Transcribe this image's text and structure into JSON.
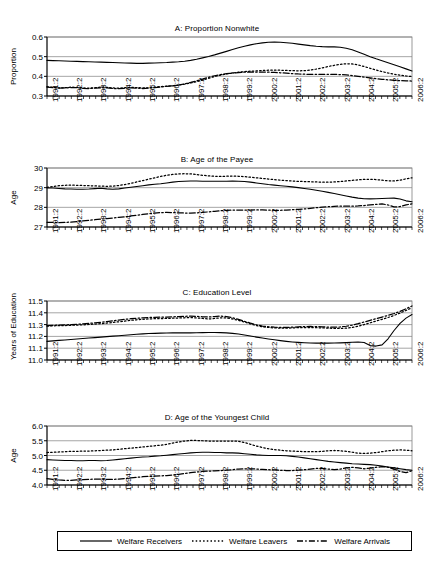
{
  "figure": {
    "background": "#ffffff",
    "line_color": "#000000",
    "grid_color": "#808080",
    "axis_color": "#000000"
  },
  "legend": {
    "items": [
      {
        "label": "Welfare Receivers",
        "style": "solid",
        "dash": "none"
      },
      {
        "label": "Welfare Leavers",
        "style": "dotted",
        "dash": "1.5,2.2"
      },
      {
        "label": "Welfare Arrivals",
        "style": "dash-dot",
        "dash": "6,2.2,1.5,2.2"
      }
    ]
  },
  "x_axis": {
    "tick_labels": [
      "1991:2",
      "1992:2",
      "1993:2",
      "1994:2",
      "1995:2",
      "1996:2",
      "1997:2",
      "1998:2",
      "1999:2",
      "2000:2",
      "2001:2",
      "2002:2",
      "2003:2",
      "2004:2",
      "2005:2",
      "2006:2"
    ],
    "minor_ticks_per_label": 4,
    "n_points": 62,
    "period_start": "1991:2",
    "period_end": "2006:3"
  },
  "chart_data": [
    {
      "type": "line",
      "panel": "A",
      "title": "A: Proportion Nonwhite",
      "xlabel": "",
      "ylabel": "Proportion",
      "ylim": [
        0.3,
        0.6
      ],
      "yticks": [
        0.3,
        0.4,
        0.5,
        0.6
      ],
      "ytick_labels": [
        "0.3",
        "0.4",
        "0.5",
        "0.6"
      ],
      "grid": true,
      "legend_position": "below-figure",
      "series": [
        {
          "name": "Welfare Receivers",
          "style": "solid",
          "values": [
            0.481,
            0.48,
            0.479,
            0.478,
            0.477,
            0.476,
            0.475,
            0.474,
            0.473,
            0.472,
            0.471,
            0.47,
            0.469,
            0.468,
            0.467,
            0.466,
            0.466,
            0.467,
            0.468,
            0.469,
            0.47,
            0.472,
            0.474,
            0.477,
            0.481,
            0.487,
            0.494,
            0.501,
            0.509,
            0.518,
            0.527,
            0.536,
            0.545,
            0.553,
            0.56,
            0.566,
            0.57,
            0.573,
            0.574,
            0.573,
            0.571,
            0.568,
            0.564,
            0.56,
            0.556,
            0.553,
            0.551,
            0.55,
            0.55,
            0.548,
            0.543,
            0.535,
            0.524,
            0.512,
            0.5,
            0.489,
            0.479,
            0.469,
            0.459,
            0.449,
            0.438,
            0.427
          ]
        },
        {
          "name": "Welfare Leavers",
          "style": "dotted",
          "values": [
            0.348,
            0.344,
            0.341,
            0.342,
            0.345,
            0.344,
            0.341,
            0.34,
            0.342,
            0.345,
            0.344,
            0.341,
            0.34,
            0.342,
            0.344,
            0.343,
            0.341,
            0.342,
            0.345,
            0.348,
            0.35,
            0.352,
            0.355,
            0.36,
            0.366,
            0.373,
            0.381,
            0.39,
            0.399,
            0.406,
            0.412,
            0.417,
            0.421,
            0.424,
            0.426,
            0.428,
            0.43,
            0.431,
            0.431,
            0.431,
            0.43,
            0.429,
            0.428,
            0.429,
            0.432,
            0.437,
            0.443,
            0.45,
            0.456,
            0.461,
            0.464,
            0.463,
            0.458,
            0.45,
            0.441,
            0.432,
            0.424,
            0.417,
            0.411,
            0.406,
            0.402,
            0.399
          ]
        },
        {
          "name": "Welfare Arrivals",
          "style": "dash-dot",
          "values": [
            0.345,
            0.342,
            0.34,
            0.341,
            0.343,
            0.342,
            0.339,
            0.338,
            0.34,
            0.342,
            0.341,
            0.338,
            0.337,
            0.339,
            0.341,
            0.34,
            0.338,
            0.34,
            0.343,
            0.346,
            0.349,
            0.352,
            0.356,
            0.362,
            0.369,
            0.377,
            0.386,
            0.395,
            0.403,
            0.409,
            0.414,
            0.417,
            0.419,
            0.421,
            0.422,
            0.422,
            0.422,
            0.421,
            0.42,
            0.418,
            0.416,
            0.414,
            0.412,
            0.411,
            0.41,
            0.41,
            0.41,
            0.41,
            0.41,
            0.409,
            0.407,
            0.404,
            0.4,
            0.396,
            0.392,
            0.388,
            0.385,
            0.382,
            0.38,
            0.378,
            0.377,
            0.376
          ]
        }
      ]
    },
    {
      "type": "line",
      "panel": "B",
      "title": "B: Age of the Payee",
      "xlabel": "",
      "ylabel": "Age",
      "ylim": [
        27,
        30
      ],
      "yticks": [
        27,
        28,
        29,
        30
      ],
      "ytick_labels": [
        "27",
        "28",
        "29",
        "30"
      ],
      "grid": true,
      "legend_position": "below-figure",
      "series": [
        {
          "name": "Welfare Receivers",
          "style": "solid",
          "values": [
            28.99,
            28.98,
            28.96,
            28.94,
            28.93,
            28.92,
            28.92,
            28.93,
            28.95,
            28.97,
            28.94,
            28.92,
            28.94,
            28.98,
            29.02,
            29.06,
            29.1,
            29.14,
            29.17,
            29.2,
            29.24,
            29.28,
            29.31,
            29.33,
            29.34,
            29.34,
            29.33,
            29.33,
            29.33,
            29.33,
            29.33,
            29.34,
            29.33,
            29.31,
            29.28,
            29.24,
            29.2,
            29.16,
            29.13,
            29.1,
            29.07,
            29.04,
            29.0,
            28.96,
            28.92,
            28.87,
            28.82,
            28.76,
            28.7,
            28.64,
            28.58,
            28.52,
            28.47,
            28.44,
            28.43,
            28.44,
            28.45,
            28.46,
            28.47,
            28.42,
            28.33,
            28.28
          ]
        },
        {
          "name": "Welfare Leavers",
          "style": "dotted",
          "values": [
            29.02,
            29.06,
            29.1,
            29.12,
            29.13,
            29.12,
            29.11,
            29.1,
            29.09,
            29.08,
            29.07,
            29.08,
            29.11,
            29.16,
            29.22,
            29.29,
            29.36,
            29.43,
            29.5,
            29.57,
            29.63,
            29.67,
            29.7,
            29.71,
            29.7,
            29.67,
            29.63,
            29.6,
            29.58,
            29.57,
            29.58,
            29.59,
            29.58,
            29.56,
            29.53,
            29.5,
            29.47,
            29.44,
            29.41,
            29.38,
            29.36,
            29.34,
            29.32,
            29.31,
            29.3,
            29.29,
            29.28,
            29.28,
            29.29,
            29.31,
            29.34,
            29.37,
            29.4,
            29.42,
            29.43,
            29.41,
            29.38,
            29.35,
            29.34,
            29.38,
            29.45,
            29.5
          ]
        },
        {
          "name": "Welfare Arrivals",
          "style": "dash-dot",
          "values": [
            27.24,
            27.23,
            27.22,
            27.23,
            27.25,
            27.28,
            27.31,
            27.34,
            27.37,
            27.4,
            27.43,
            27.46,
            27.49,
            27.52,
            27.56,
            27.6,
            27.64,
            27.68,
            27.71,
            27.73,
            27.74,
            27.73,
            27.72,
            27.71,
            27.71,
            27.72,
            27.74,
            27.77,
            27.8,
            27.83,
            27.85,
            27.86,
            27.86,
            27.86,
            27.86,
            27.87,
            27.87,
            27.86,
            27.85,
            27.85,
            27.86,
            27.88,
            27.9,
            27.92,
            27.95,
            27.98,
            28.01,
            28.03,
            28.05,
            28.06,
            28.06,
            28.06,
            28.07,
            28.09,
            28.12,
            28.15,
            28.17,
            28.12,
            28.02,
            28.04,
            28.12,
            28.18
          ]
        }
      ]
    },
    {
      "type": "line",
      "panel": "C",
      "title": "C: Education Level",
      "xlabel": "",
      "ylabel": "Years of Education",
      "ylim": [
        11.0,
        11.5
      ],
      "yticks": [
        11.0,
        11.1,
        11.2,
        11.3,
        11.4,
        11.5
      ],
      "ytick_labels": [
        "11.0",
        "11.1",
        "11.2",
        "11.3",
        "11.4",
        "11.5"
      ],
      "grid": true,
      "legend_position": "below-figure",
      "series": [
        {
          "name": "Welfare Receivers",
          "style": "solid",
          "values": [
            11.158,
            11.162,
            11.166,
            11.17,
            11.174,
            11.178,
            11.182,
            11.186,
            11.19,
            11.194,
            11.198,
            11.202,
            11.206,
            11.21,
            11.214,
            11.218,
            11.221,
            11.224,
            11.226,
            11.228,
            11.229,
            11.23,
            11.23,
            11.23,
            11.23,
            11.231,
            11.232,
            11.233,
            11.233,
            11.232,
            11.23,
            11.226,
            11.22,
            11.212,
            11.203,
            11.194,
            11.186,
            11.178,
            11.171,
            11.164,
            11.158,
            11.153,
            11.149,
            11.146,
            11.144,
            11.143,
            11.143,
            11.143,
            11.144,
            11.145,
            11.147,
            11.15,
            11.152,
            11.148,
            11.122,
            11.118,
            11.128,
            11.18,
            11.25,
            11.31,
            11.355,
            11.385
          ]
        },
        {
          "name": "Welfare Leavers",
          "style": "dotted",
          "values": [
            11.287,
            11.29,
            11.291,
            11.292,
            11.294,
            11.296,
            11.298,
            11.301,
            11.304,
            11.308,
            11.313,
            11.318,
            11.324,
            11.33,
            11.336,
            11.341,
            11.345,
            11.348,
            11.35,
            11.351,
            11.352,
            11.354,
            11.356,
            11.358,
            11.36,
            11.357,
            11.352,
            11.348,
            11.352,
            11.358,
            11.356,
            11.348,
            11.336,
            11.322,
            11.306,
            11.292,
            11.282,
            11.276,
            11.272,
            11.27,
            11.27,
            11.272,
            11.274,
            11.275,
            11.275,
            11.274,
            11.272,
            11.27,
            11.268,
            11.268,
            11.27,
            11.276,
            11.286,
            11.3,
            11.315,
            11.33,
            11.345,
            11.36,
            11.378,
            11.398,
            11.42,
            11.442
          ]
        },
        {
          "name": "Welfare Arrivals",
          "style": "dash-dot",
          "values": [
            11.292,
            11.294,
            11.295,
            11.297,
            11.3,
            11.303,
            11.306,
            11.31,
            11.315,
            11.32,
            11.326,
            11.332,
            11.338,
            11.344,
            11.35,
            11.354,
            11.357,
            11.36,
            11.362,
            11.363,
            11.364,
            11.366,
            11.368,
            11.37,
            11.372,
            11.37,
            11.366,
            11.364,
            11.368,
            11.372,
            11.368,
            11.358,
            11.344,
            11.328,
            11.312,
            11.298,
            11.288,
            11.282,
            11.278,
            11.276,
            11.276,
            11.278,
            11.281,
            11.283,
            11.284,
            11.283,
            11.281,
            11.279,
            11.278,
            11.28,
            11.286,
            11.296,
            11.308,
            11.322,
            11.336,
            11.35,
            11.364,
            11.378,
            11.394,
            11.412,
            11.434,
            11.458
          ]
        }
      ]
    },
    {
      "type": "line",
      "panel": "D",
      "title": "D: Age of the Youngest Child",
      "xlabel": "",
      "ylabel": "Age",
      "ylim": [
        4.0,
        6.0
      ],
      "yticks": [
        4.0,
        4.5,
        5.0,
        5.5,
        6.0
      ],
      "ytick_labels": [
        "4.0",
        "4.5",
        "5.0",
        "5.5",
        "6.0"
      ],
      "grid": true,
      "legend_position": "below-figure",
      "series": [
        {
          "name": "Welfare Receivers",
          "style": "solid",
          "values": [
            4.86,
            4.85,
            4.84,
            4.83,
            4.83,
            4.82,
            4.82,
            4.83,
            4.83,
            4.82,
            4.83,
            4.85,
            4.87,
            4.89,
            4.91,
            4.93,
            4.95,
            4.96,
            4.98,
            4.99,
            5.01,
            5.03,
            5.05,
            5.07,
            5.09,
            5.1,
            5.11,
            5.11,
            5.1,
            5.1,
            5.09,
            5.09,
            5.08,
            5.06,
            5.04,
            5.02,
            5.01,
            5.0,
            5.0,
            5.0,
            4.99,
            4.97,
            4.95,
            4.92,
            4.89,
            4.86,
            4.83,
            4.8,
            4.78,
            4.76,
            4.74,
            4.72,
            4.71,
            4.7,
            4.69,
            4.67,
            4.64,
            4.61,
            4.58,
            4.55,
            4.52,
            4.5
          ]
        },
        {
          "name": "Welfare Leavers",
          "style": "dotted",
          "values": [
            5.1,
            5.11,
            5.12,
            5.13,
            5.14,
            5.14,
            5.15,
            5.15,
            5.16,
            5.17,
            5.18,
            5.19,
            5.21,
            5.23,
            5.25,
            5.27,
            5.29,
            5.31,
            5.33,
            5.35,
            5.38,
            5.42,
            5.46,
            5.49,
            5.51,
            5.51,
            5.5,
            5.49,
            5.49,
            5.49,
            5.49,
            5.49,
            5.48,
            5.44,
            5.38,
            5.32,
            5.27,
            5.23,
            5.2,
            5.18,
            5.16,
            5.15,
            5.14,
            5.13,
            5.13,
            5.13,
            5.14,
            5.16,
            5.17,
            5.16,
            5.14,
            5.11,
            5.08,
            5.07,
            5.08,
            5.1,
            5.13,
            5.16,
            5.18,
            5.19,
            5.18,
            5.16
          ]
        },
        {
          "name": "Welfare Arrivals",
          "style": "dash-dot",
          "values": [
            4.22,
            4.19,
            4.17,
            4.16,
            4.16,
            4.17,
            4.18,
            4.19,
            4.2,
            4.2,
            4.19,
            4.19,
            4.2,
            4.22,
            4.24,
            4.26,
            4.28,
            4.29,
            4.3,
            4.31,
            4.32,
            4.34,
            4.36,
            4.39,
            4.42,
            4.44,
            4.46,
            4.47,
            4.48,
            4.49,
            4.5,
            4.52,
            4.54,
            4.55,
            4.55,
            4.54,
            4.53,
            4.52,
            4.51,
            4.5,
            4.49,
            4.49,
            4.5,
            4.52,
            4.54,
            4.56,
            4.56,
            4.54,
            4.52,
            4.54,
            4.58,
            4.6,
            4.58,
            4.55,
            4.57,
            4.6,
            4.62,
            4.6,
            4.54,
            4.46,
            4.42,
            4.48
          ]
        }
      ]
    }
  ]
}
